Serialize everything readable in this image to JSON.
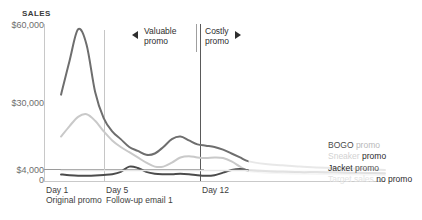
{
  "axis": {
    "y_title": "SALES",
    "y_labels": {
      "top": "$60,000",
      "mid": "$30,000",
      "threshold": "$4,000",
      "zero": "0"
    },
    "x_day1": "Day 1",
    "x_day1_sub": "Original promo",
    "x_day5": "Day 5",
    "x_day5_sub": "Follow-up email 1",
    "x_day12": "Day 12"
  },
  "annotations": {
    "valuable": "Valuable promo",
    "costly": "Costly promo",
    "arrow_left": "left-arrow-icon",
    "arrow_right": "right-arrow-icon"
  },
  "legend": [
    {
      "name_part": "BOGO",
      "promo_part": " promo",
      "name_color": "#4a4a4a",
      "promo_color": "#b9b9b9"
    },
    {
      "name_part": "Sneaker",
      "promo_part": " promo",
      "name_color": "#d2d2d2",
      "promo_color": "#2b2b2b"
    },
    {
      "name_part": "Jacket",
      "promo_part": " promo",
      "name_color": "#2b2b2b",
      "promo_color": "#555555"
    },
    {
      "name_part": "Target sales",
      "promo_part": " no promo",
      "name_color": "#e2e2e2",
      "promo_color": "#2b2b2b"
    }
  ],
  "colors": {
    "bogo": "#6e6e6e",
    "sneaker": "#c9c9c9",
    "jacket": "#4b4b4b",
    "target": "#e6e6e6",
    "axis": "#c8c8c8",
    "divider": "#5a5a5a",
    "text": "#3d3d3d"
  },
  "chart_data": {
    "type": "line",
    "title": "",
    "xlabel": "",
    "ylabel": "SALES",
    "ylim": [
      0,
      60000
    ],
    "xlim": [
      0,
      20
    ],
    "grid": false,
    "legend_position": "right",
    "y_ticks": [
      0,
      4000,
      30000,
      60000
    ],
    "y_ticklabels": [
      "0",
      "$4,000",
      "$30,000",
      "$60,000"
    ],
    "x_ticks": [
      1,
      5,
      12
    ],
    "x_ticklabels": [
      "Day 1",
      "Day 5",
      "Day 12"
    ],
    "x_tick_sublabels": [
      "Original promo",
      "Follow-up email 1",
      ""
    ],
    "annotations": [
      {
        "text": "Valuable promo",
        "x_range": [
          1,
          12
        ],
        "arrow": "left"
      },
      {
        "text": "Costly promo",
        "x_range": [
          12,
          20
        ],
        "arrow": "right"
      }
    ],
    "x": [
      1,
      1.5,
      2,
      2.5,
      3,
      3.5,
      4,
      4.5,
      5,
      5.5,
      6,
      6.5,
      7,
      7.5,
      8,
      8.5,
      9,
      9.5,
      10,
      10.5,
      11,
      11.5,
      12,
      13,
      14,
      15,
      16,
      17,
      18,
      19,
      20
    ],
    "series": [
      {
        "name": "BOGO promo",
        "color": "#6e6e6e",
        "values": [
          33000,
          46000,
          58000,
          52000,
          34000,
          24000,
          19000,
          16000,
          13000,
          11500,
          10000,
          10500,
          13000,
          16000,
          17000,
          15500,
          14000,
          13500,
          13000,
          12000,
          10500,
          9000,
          7500,
          6500,
          6000,
          5500,
          5200,
          5000,
          4800,
          4500,
          4200
        ]
      },
      {
        "name": "Sneaker promo",
        "color": "#c9c9c9",
        "values": [
          17000,
          21000,
          24500,
          25500,
          23000,
          19000,
          15500,
          13000,
          11000,
          9000,
          7000,
          5500,
          5500,
          7000,
          9000,
          9500,
          9000,
          8800,
          9000,
          8800,
          7500,
          5500,
          3800,
          3200,
          3000,
          2800,
          2700,
          2600,
          2500,
          2400,
          2300
        ]
      },
      {
        "name": "Jacket promo",
        "color": "#4b4b4b",
        "values": [
          2500,
          2200,
          2000,
          2000,
          2100,
          2300,
          2600,
          3500,
          5500,
          5000,
          3500,
          2800,
          2600,
          2600,
          2800,
          2600,
          2200,
          2000,
          2200,
          3200,
          4200,
          4600,
          4200,
          3800,
          3600,
          3400,
          3400,
          3300,
          3200,
          3100,
          3000
        ]
      },
      {
        "name": "Target sales no promo",
        "color": "#e6e6e6",
        "values": [
          4000,
          4000,
          4000,
          4000,
          4000,
          4000,
          4000,
          4000,
          4000,
          4000,
          4000,
          4000,
          4000,
          4000,
          4000,
          4000,
          4000,
          4000,
          4000,
          4000,
          4000,
          4000,
          4000,
          4000,
          4000,
          4000,
          4000,
          4000,
          4000,
          4000,
          4000
        ]
      }
    ]
  }
}
